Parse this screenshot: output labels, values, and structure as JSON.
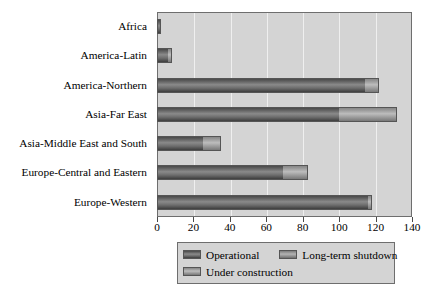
{
  "chart_data": {
    "type": "bar",
    "orientation": "horizontal",
    "stacked": true,
    "title": "",
    "xlabel": "",
    "ylabel": "",
    "xlim": [
      0,
      140
    ],
    "xticks": [
      0,
      20,
      40,
      60,
      80,
      100,
      120,
      140
    ],
    "grid": true,
    "legend_position": "bottom",
    "categories": [
      "Africa",
      "America-Latin",
      "America-Northern",
      "Asia-Far East",
      "Asia-Middle East and South",
      "Europe-Central and Eastern",
      "Europe-Western"
    ],
    "series": [
      {
        "name": "Operational",
        "color": "#5c5c5c",
        "values": [
          2,
          6,
          114,
          100,
          25,
          69,
          116
        ]
      },
      {
        "name": "Long-term shutdown",
        "color": "#8d8d8d",
        "values": [
          0,
          0,
          0,
          0,
          0,
          0,
          0
        ]
      },
      {
        "name": "Under construction",
        "color": "#969696",
        "values": [
          0,
          2,
          8,
          32,
          10,
          14,
          2
        ]
      }
    ],
    "totals": [
      2,
      8,
      122,
      132,
      35,
      83,
      118
    ]
  },
  "axis": {
    "tick_labels": [
      "0",
      "20",
      "40",
      "60",
      "80",
      "100",
      "120",
      "140"
    ]
  },
  "legend": {
    "entries": [
      {
        "label": "Operational",
        "swatch": "operational"
      },
      {
        "label": "Long-term shutdown",
        "swatch": "longterm"
      },
      {
        "label": "Under construction",
        "swatch": "underconstruction"
      }
    ]
  },
  "colors": {
    "plot_background": "#d4d4d4",
    "gridline": "#efefef",
    "axis": "#6e6e6e",
    "operational": "#5c5c5c",
    "longterm": "#8d8d8d",
    "underconstruction": "#969696"
  }
}
